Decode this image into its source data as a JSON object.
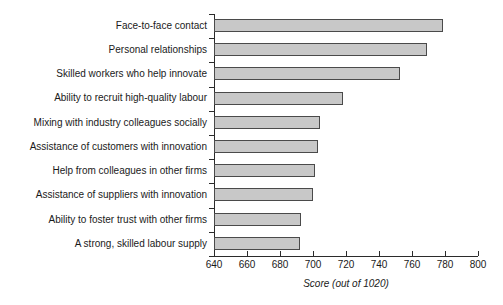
{
  "chart_data": {
    "type": "bar",
    "orientation": "horizontal",
    "title": "",
    "xlabel": "Score (out of 1020)",
    "ylabel": "",
    "xlim": [
      640,
      800
    ],
    "xticks": [
      640,
      660,
      680,
      700,
      720,
      740,
      760,
      780,
      800
    ],
    "xticklabels": [
      "640",
      "660",
      "680",
      "700",
      "720",
      "740",
      "760",
      "780",
      "800"
    ],
    "grid": false,
    "legend": null,
    "bar_color": "#c8c8c8",
    "bar_edge_color": "#4a4a4a",
    "categories": [
      "Face-to-face contact",
      "Personal relationships",
      "Skilled workers who help innovate",
      "Ability to recruit high-quality labour",
      "Mixing with industry colleagues socially",
      "Assistance of customers with innovation",
      "Help from colleagues in other firms",
      "Assistance of suppliers with innovation",
      "Ability to foster trust with other firms",
      "A strong, skilled labour supply"
    ],
    "values": [
      779,
      769,
      753,
      718,
      704,
      703,
      701,
      700,
      693,
      692
    ]
  }
}
